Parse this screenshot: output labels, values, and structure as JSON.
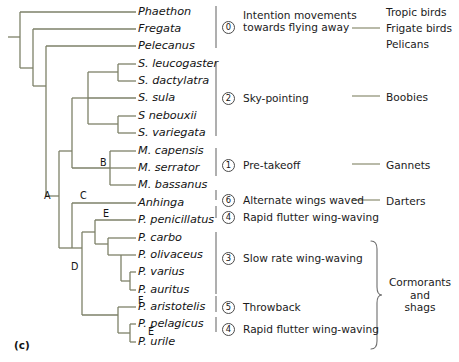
{
  "figure": {
    "panel_letter": "(c)",
    "branch_color": "#7d8168",
    "text_color": "#1a1a1a",
    "background": "#ffffff"
  },
  "taxa": [
    {
      "name": "Phaethon",
      "y": 12
    },
    {
      "name": "Fregata",
      "y": 29
    },
    {
      "name": "Pelecanus",
      "y": 46
    },
    {
      "name": "S. leucogaster",
      "y": 64
    },
    {
      "name": "S. dactylatra",
      "y": 81
    },
    {
      "name": "S. sula",
      "y": 98
    },
    {
      "name": "S nebouxii",
      "y": 116
    },
    {
      "name": "S. variegata",
      "y": 133
    },
    {
      "name": "M. capensis",
      "y": 151
    },
    {
      "name": "M. serrator",
      "y": 168
    },
    {
      "name": "M. bassanus",
      "y": 185
    },
    {
      "name": "Anhinga",
      "y": 203
    },
    {
      "name": "P. penicillatus",
      "y": 220
    },
    {
      "name": "P. carbo",
      "y": 238
    },
    {
      "name": "P. olivaceus",
      "y": 255
    },
    {
      "name": "P. varius",
      "y": 272
    },
    {
      "name": "P. auritus",
      "y": 290
    },
    {
      "name": "P. aristotelis",
      "y": 307
    },
    {
      "name": "P. pelagicus",
      "y": 324
    },
    {
      "name": "P. urile",
      "y": 342
    }
  ],
  "node_letters": [
    {
      "label": "A",
      "x": 44,
      "y": 196
    },
    {
      "label": "B",
      "x": 100,
      "y": 163
    },
    {
      "label": "C",
      "x": 80,
      "y": 196
    },
    {
      "label": "D",
      "x": 71,
      "y": 266
    },
    {
      "label": "E",
      "x": 103,
      "y": 213
    },
    {
      "label": "F",
      "x": 138,
      "y": 300
    },
    {
      "label": "E",
      "x": 148,
      "y": 330
    }
  ],
  "behaviors": [
    {
      "number": "0",
      "circle_y": 14,
      "text": "Intention movements\ntowards flying away",
      "text_y": 9
    },
    {
      "number": "2",
      "circle_y": 92,
      "text": "Sky-pointing",
      "text_y": 91
    },
    {
      "number": "1",
      "circle_y": 160,
      "text": "Pre-takeoff",
      "text_y": 159
    },
    {
      "number": "6",
      "circle_y": 196,
      "text": "Alternate wings waved",
      "text_y": 195
    },
    {
      "number": "4",
      "circle_y": 212,
      "text": "Rapid flutter wing-waving",
      "text_y": 211
    },
    {
      "number": "3",
      "circle_y": 253,
      "text": "Slow rate wing-waving",
      "text_y": 252
    },
    {
      "number": "5",
      "circle_y": 302,
      "text": "Throwback",
      "text_y": 301
    },
    {
      "number": "4",
      "circle_y": 324,
      "text": "Rapid flutter wing-waving",
      "text_y": 323
    }
  ],
  "groups": [
    {
      "name": "Tropic birds",
      "x": 386,
      "y": 6
    },
    {
      "name": "Frigate birds",
      "x": 386,
      "y": 22
    },
    {
      "name": "Pelicans",
      "x": 386,
      "y": 38
    },
    {
      "name": "Boobies",
      "x": 386,
      "y": 91
    },
    {
      "name": "Gannets",
      "x": 386,
      "y": 159
    },
    {
      "name": "Darters",
      "x": 386,
      "y": 195
    },
    {
      "name": "Cormorants\nand\nshags",
      "x": 384,
      "y": 276
    }
  ]
}
